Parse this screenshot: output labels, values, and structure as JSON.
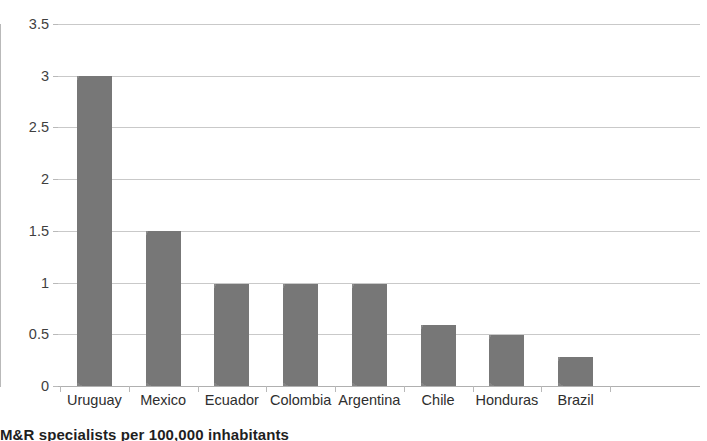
{
  "chart_data": {
    "type": "bar",
    "title": "",
    "subtitle": "",
    "xlabel": "",
    "ylabel": "",
    "categories": [
      "Uruguay",
      "Mexico",
      "Ecuador",
      "Colombia",
      "Argentina",
      "Chile",
      "Honduras",
      "Brazil"
    ],
    "values": [
      3.0,
      1.5,
      0.99,
      0.99,
      0.99,
      0.59,
      0.49,
      0.28
    ],
    "series": [
      {
        "name": "M&R specialists per 100,000 inhabitants",
        "values": [
          3.0,
          1.5,
          0.99,
          0.99,
          0.99,
          0.59,
          0.49,
          0.28
        ]
      }
    ],
    "ylim": [
      0,
      3.5
    ],
    "yticks": [
      0,
      0.5,
      1,
      1.5,
      2,
      2.5,
      3,
      3.5
    ],
    "ytick_labels": [
      "0",
      "0.5",
      "1",
      "1.5",
      "2",
      "2.5",
      "3",
      "3.5"
    ],
    "grid": "horizontal",
    "legend": "none",
    "bar_color": "#828282",
    "gridline_color": "#c9c9c9",
    "axis_color": "#b9b9b9"
  },
  "caption": {
    "text": "M&R specialists per 100,000 inhabitants"
  }
}
